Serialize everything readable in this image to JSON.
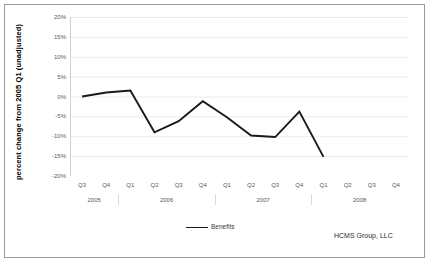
{
  "chart_data": {
    "type": "line",
    "title": "",
    "xlabel": "",
    "ylabel": "percent change from 2005 Q1 (unadjusted)",
    "ylim": [
      -20,
      20
    ],
    "ytick_labels": [
      "20%",
      "15%",
      "10%",
      "5%",
      "0%",
      "-5%",
      "-10%",
      "-15%",
      "-20%"
    ],
    "ytick_values": [
      20,
      15,
      10,
      5,
      0,
      -5,
      -10,
      -15,
      -20
    ],
    "grid": true,
    "legend_position": "bottom-center",
    "categories": [
      "Q3",
      "Q4",
      "Q1",
      "Q2",
      "Q3",
      "Q4",
      "Q1",
      "Q2",
      "Q3",
      "Q4",
      "Q1",
      "Q2",
      "Q3",
      "Q4"
    ],
    "year_groups": [
      {
        "label": "2005",
        "start_index": 0,
        "end_index": 1
      },
      {
        "label": "2006",
        "start_index": 2,
        "end_index": 5
      },
      {
        "label": "2007",
        "start_index": 6,
        "end_index": 9
      },
      {
        "label": "2008",
        "start_index": 10,
        "end_index": 13
      }
    ],
    "series": [
      {
        "name": "Benefits",
        "color": "#1a1a1a",
        "values": [
          0.0,
          1.0,
          1.5,
          -9.0,
          -6.2,
          -1.2,
          -5.2,
          -9.8,
          -10.2,
          -3.8,
          -15.2,
          null,
          null,
          null
        ]
      }
    ]
  },
  "legend": {
    "entries": [
      {
        "label": "Benefits"
      }
    ]
  },
  "attribution": {
    "text": "HCMS Group, LLC"
  }
}
